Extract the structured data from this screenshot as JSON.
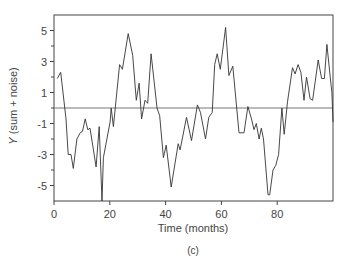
{
  "chart_data": {
    "type": "line",
    "title": "",
    "caption": "(c)",
    "xlabel": "Time (months)",
    "ylabel": "Y (sum + noise)",
    "ylabel_italic_part": "Y",
    "ylabel_rest": " (sum + noise)",
    "xlim": [
      0,
      100
    ],
    "ylim": [
      -6,
      6
    ],
    "xticks": [
      0,
      20,
      40,
      60,
      80
    ],
    "yticks": [
      5,
      3,
      1,
      -1,
      -3,
      -5
    ],
    "yminor_ticks": [
      4,
      2,
      0,
      -2,
      -4
    ],
    "grid": false,
    "reference_line": {
      "y": 0,
      "color": "#777777"
    },
    "line_color": "#333333",
    "series": [
      {
        "name": "Y (sum + noise)",
        "x": [
          1.2,
          2.4,
          4.3,
          5.1,
          6.1,
          6.9,
          8.2,
          9.4,
          10.2,
          11.2,
          12.1,
          12.9,
          15.1,
          16.2,
          17.2,
          17.7,
          20.1,
          20.5,
          21.3,
          23.5,
          24.5,
          26.6,
          28.2,
          29.5,
          30.5,
          31.4,
          32.6,
          33.6,
          34.8,
          36.9,
          37.9,
          39.2,
          40.2,
          42.0,
          44.5,
          45.2,
          47.5,
          49.3,
          51.4,
          52.5,
          54.3,
          55.5,
          56.7,
          57.6,
          58.5,
          59.6,
          61.5,
          62.7,
          64.1,
          66.3,
          68.1,
          69.5,
          70.8,
          71.7,
          72.5,
          73.5,
          74.3,
          75.1,
          76.7,
          77.3,
          78.5,
          79.5,
          80.5,
          81.7,
          82.5,
          83.7,
          85.5,
          86.4,
          87.5,
          88.5,
          89.6,
          90.5,
          91.8,
          92.7,
          94.7,
          95.9,
          96.9,
          97.8,
          99.0,
          99.6,
          100.0
        ],
        "y": [
          1.9,
          2.3,
          -0.7,
          -3.0,
          -3.0,
          -3.9,
          -2.0,
          -1.6,
          -1.5,
          -0.7,
          -1.4,
          -1.3,
          -3.8,
          -1.2,
          -6.0,
          -3.2,
          -0.9,
          0.0,
          -1.2,
          2.8,
          2.5,
          4.8,
          3.4,
          0.5,
          1.6,
          -0.7,
          0.5,
          0.3,
          3.5,
          0.0,
          -0.5,
          -3.2,
          -2.4,
          -5.1,
          -2.3,
          -2.7,
          -0.6,
          -2.1,
          0.2,
          -0.3,
          -2.0,
          -0.6,
          -0.3,
          2.8,
          3.5,
          2.5,
          5.2,
          2.1,
          2.7,
          -1.6,
          -1.6,
          0.1,
          -0.7,
          -1.4,
          -1.0,
          -2.0,
          -1.3,
          -2.0,
          -5.6,
          -5.6,
          -4.0,
          -3.7,
          -3.0,
          0.0,
          -1.7,
          0.4,
          2.6,
          2.2,
          2.8,
          2.3,
          0.5,
          2.0,
          0.6,
          0.5,
          3.1,
          1.9,
          1.9,
          4.1,
          2.0,
          1.0,
          -0.9
        ]
      }
    ]
  },
  "axes": {
    "x_tick_labels": [
      "0",
      "20",
      "40",
      "60",
      "80"
    ],
    "y_tick_labels": [
      "5",
      "3",
      "1",
      "-1",
      "-3",
      "-5"
    ]
  }
}
